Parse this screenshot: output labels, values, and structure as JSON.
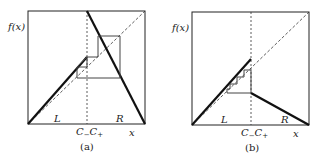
{
  "panels": [
    {
      "id": "a",
      "caption": "(a)",
      "y_label": "f(x)",
      "x_label": "x",
      "region_left": "L",
      "region_right": "R",
      "boundary_left": "C",
      "boundary_left_sub": "−",
      "boundary_right": "C",
      "boundary_right_sub": "+"
    },
    {
      "id": "b",
      "caption": "(b)",
      "y_label": "f(x)",
      "x_label": "x",
      "region_left": "L",
      "region_right": "R",
      "boundary_left": "C",
      "boundary_left_sub": "−",
      "boundary_right": "C",
      "boundary_right_sub": "+"
    }
  ],
  "colors": {
    "line": "#111111",
    "cobweb": "#444444",
    "frame": "#222222"
  }
}
